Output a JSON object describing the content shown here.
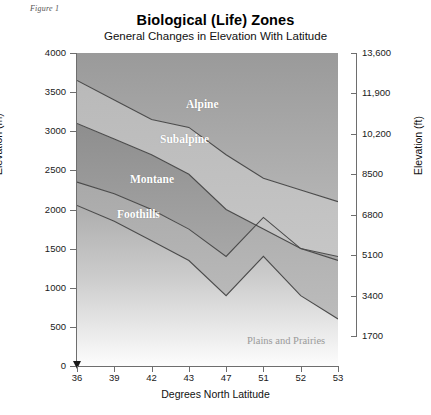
{
  "figure": {
    "caption": "Figure 1"
  },
  "title": "Biological (Life) Zones",
  "subtitle": "General Changes in Elevation With Latitude",
  "axes": {
    "left": {
      "title": "Elevation (m)",
      "ticks": [
        "4000",
        "3500",
        "3000",
        "2500",
        "2000",
        "1500",
        "1000",
        "500",
        "0"
      ]
    },
    "right": {
      "title": "Elevation (ft)",
      "ticks": [
        "13,600",
        "11,900",
        "10,200",
        "8500",
        "6800",
        "5100",
        "3400",
        "1700"
      ]
    },
    "bottom": {
      "title": "Degrees North Latitude",
      "ticks": [
        "36",
        "39",
        "42",
        "43",
        "47",
        "51",
        "52",
        "53"
      ]
    }
  },
  "zone_labels": [
    {
      "name": "Alpine",
      "x": 186,
      "y": 105
    },
    {
      "name": "Subalpine",
      "x": 160,
      "y": 140
    },
    {
      "name": "Montane",
      "x": 130,
      "y": 180
    },
    {
      "name": "Foothills",
      "x": 117,
      "y": 215
    },
    {
      "name": "Plains and Prairies",
      "x": 247,
      "y": 341
    }
  ],
  "colors": {
    "alpine": "#9d9d9d",
    "subalpine": "#b5b5b5",
    "montane": "#959595",
    "foothills": "#b0b0b0",
    "plains": "#c0c0c0",
    "boundary_line": "#4a4a4a",
    "axis": "#6e6e6e",
    "text": "#1a1a1a"
  },
  "chart_data": {
    "type": "area",
    "title": "Biological (Life) Zones",
    "subtitle": "General Changes in Elevation With Latitude",
    "xlabel": "Degrees North Latitude",
    "ylabel": "Elevation (m)",
    "ylabel_secondary": "Elevation (ft)",
    "ylim": [
      0,
      4000
    ],
    "ylim_secondary": [
      0,
      13600
    ],
    "grid": false,
    "legend": "in-plot labels",
    "x": [
      36,
      39,
      42,
      43,
      47,
      51,
      52,
      53
    ],
    "x_spacing": "categorical (evenly spaced)",
    "series": [
      {
        "name": "Alpine upper limit (plot ceiling)",
        "values": [
          4000,
          4000,
          4000,
          4000,
          4000,
          4000,
          4000,
          4000
        ]
      },
      {
        "name": "Alpine / Subalpine boundary",
        "values": [
          3650,
          3400,
          3150,
          3050,
          2700,
          2400,
          2250,
          2100
        ]
      },
      {
        "name": "Subalpine / Montane boundary",
        "values": [
          3100,
          2900,
          2700,
          2450,
          2000,
          1750,
          1500,
          1400
        ]
      },
      {
        "name": "Montane / Foothills boundary",
        "values": [
          2350,
          2200,
          2000,
          1750,
          1400,
          1900,
          1500,
          1350
        ]
      },
      {
        "name": "Foothills / Plains boundary",
        "values": [
          2050,
          1850,
          1600,
          1350,
          900,
          1400,
          900,
          600
        ]
      }
    ],
    "bands": [
      "Alpine",
      "Subalpine",
      "Montane",
      "Foothills",
      "Plains and Prairies"
    ]
  }
}
